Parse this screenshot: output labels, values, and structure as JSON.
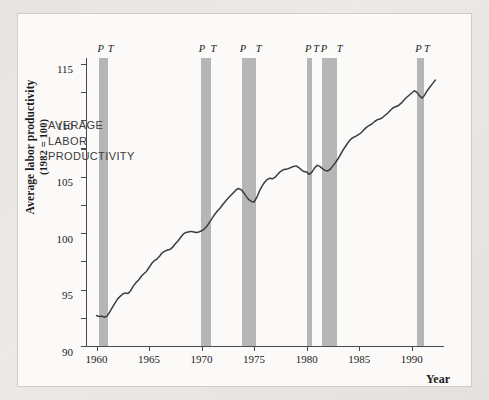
{
  "figure": {
    "background_color": "#fbfaf8",
    "page_color": "#e6e5e1",
    "band_color": "#b6b6b6",
    "line_color": "#3d3d3d"
  },
  "annotation": {
    "line1": "AVERAGE",
    "line2": "LABOR",
    "line3": "PRODUCTIVITY"
  },
  "axis": {
    "ylabel_line1": "Average labor productivity",
    "ylabel_line2": "(1982 = 100)",
    "xlabel": "Year"
  },
  "chart_data": {
    "type": "line",
    "title": "",
    "xlabel": "Year",
    "ylabel": "Average labor productivity (1982 = 100)",
    "xlim": [
      1959.0,
      1992.5
    ],
    "ylim": [
      65,
      116
    ],
    "yticks": [
      65,
      70,
      75,
      80,
      85,
      90,
      95,
      100,
      105,
      110,
      115
    ],
    "xticks": [
      1960,
      1965,
      1970,
      1975,
      1980,
      1985,
      1990
    ],
    "grid": false,
    "legend": null,
    "series": [
      {
        "name": "Average labor productivity",
        "x": [
          1960.0,
          1960.25,
          1960.5,
          1960.75,
          1961.0,
          1961.25,
          1961.5,
          1961.75,
          1962.0,
          1962.25,
          1962.5,
          1962.75,
          1963.0,
          1963.25,
          1963.5,
          1963.75,
          1964.0,
          1964.25,
          1964.5,
          1964.75,
          1965.0,
          1965.25,
          1965.5,
          1965.75,
          1966.0,
          1966.25,
          1966.5,
          1966.75,
          1967.0,
          1967.25,
          1967.5,
          1967.75,
          1968.0,
          1968.25,
          1968.5,
          1968.75,
          1969.0,
          1969.25,
          1969.5,
          1969.75,
          1970.0,
          1970.25,
          1970.5,
          1970.75,
          1971.0,
          1971.25,
          1971.5,
          1971.75,
          1972.0,
          1972.25,
          1972.5,
          1972.75,
          1973.0,
          1973.25,
          1973.5,
          1973.75,
          1974.0,
          1974.25,
          1974.5,
          1974.75,
          1975.0,
          1975.25,
          1975.5,
          1975.75,
          1976.0,
          1976.25,
          1976.5,
          1976.75,
          1977.0,
          1977.25,
          1977.5,
          1977.75,
          1978.0,
          1978.25,
          1978.5,
          1978.75,
          1979.0,
          1979.25,
          1979.5,
          1979.75,
          1980.0,
          1980.25,
          1980.5,
          1980.75,
          1981.0,
          1981.25,
          1981.5,
          1981.75,
          1982.0,
          1982.25,
          1982.5,
          1982.75,
          1983.0,
          1983.25,
          1983.5,
          1983.75,
          1984.0,
          1984.25,
          1984.5,
          1984.75,
          1985.0,
          1985.25,
          1985.5,
          1985.75,
          1986.0,
          1986.25,
          1986.5,
          1986.75,
          1987.0,
          1987.25,
          1987.5,
          1987.75,
          1988.0,
          1988.25,
          1988.5,
          1988.75,
          1989.0,
          1989.25,
          1989.5,
          1989.75,
          1990.0,
          1990.25,
          1990.5,
          1990.75,
          1991.0,
          1991.25,
          1991.5,
          1991.75,
          1992.0,
          1992.25
        ],
        "y": [
          70.4,
          70.2,
          70.3,
          70.1,
          70.3,
          71.0,
          71.8,
          72.6,
          73.3,
          73.8,
          74.2,
          74.4,
          74.3,
          74.8,
          75.6,
          76.2,
          76.7,
          77.3,
          77.8,
          78.2,
          78.9,
          79.6,
          80.1,
          80.4,
          80.9,
          81.5,
          81.8,
          82.0,
          82.1,
          82.5,
          83.1,
          83.6,
          84.2,
          84.8,
          85.1,
          85.2,
          85.3,
          85.2,
          85.1,
          85.2,
          85.4,
          85.7,
          86.2,
          86.9,
          87.6,
          88.3,
          88.9,
          89.4,
          90.0,
          90.6,
          91.1,
          91.6,
          92.1,
          92.6,
          92.9,
          92.7,
          92.2,
          91.5,
          90.9,
          90.6,
          90.5,
          91.3,
          92.4,
          93.3,
          94.0,
          94.5,
          94.7,
          94.6,
          94.9,
          95.4,
          95.9,
          96.2,
          96.3,
          96.4,
          96.6,
          96.8,
          96.9,
          96.6,
          96.2,
          95.9,
          95.8,
          95.4,
          95.8,
          96.5,
          97.0,
          96.8,
          96.4,
          96.1,
          96.0,
          96.3,
          96.9,
          97.5,
          98.2,
          99.0,
          99.8,
          100.5,
          101.2,
          101.7,
          102.0,
          102.2,
          102.5,
          102.9,
          103.4,
          103.8,
          104.1,
          104.4,
          104.8,
          105.1,
          105.2,
          105.5,
          105.9,
          106.3,
          106.8,
          107.2,
          107.4,
          107.6,
          108.0,
          108.5,
          109.0,
          109.4,
          109.8,
          110.2,
          109.9,
          109.3,
          108.9,
          109.5,
          110.3,
          110.9,
          111.5,
          112.1
        ]
      }
    ],
    "recessions": [
      {
        "peak": 1960.25,
        "trough": 1961.1,
        "peak_label": "P",
        "trough_label": "T"
      },
      {
        "peak": 1969.9,
        "trough": 1970.9,
        "peak_label": "P",
        "trough_label": "T"
      },
      {
        "peak": 1973.8,
        "trough": 1975.2,
        "peak_label": "P",
        "trough_label": "T"
      },
      {
        "peak": 1980.0,
        "trough": 1980.5,
        "peak_label": "P",
        "trough_label": "T"
      },
      {
        "peak": 1981.5,
        "trough": 1982.9,
        "peak_label": "P",
        "trough_label": "T"
      },
      {
        "peak": 1990.5,
        "trough": 1991.2,
        "peak_label": "P",
        "trough_label": "T"
      }
    ]
  }
}
